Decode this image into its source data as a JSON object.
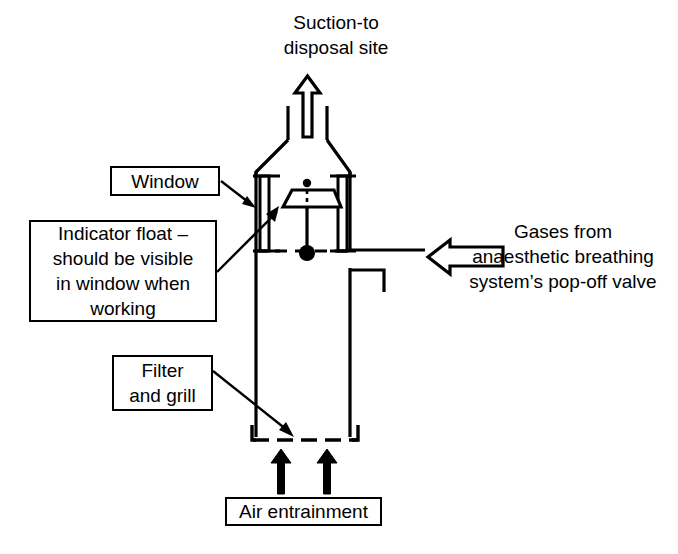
{
  "diagram": {
    "labels": {
      "suction": [
        "Suction-to",
        "disposal site"
      ],
      "window": [
        "Window"
      ],
      "indicator_float": [
        "Indicator float –",
        "should be visible",
        "in window when",
        "working"
      ],
      "filter_grill": [
        "Filter",
        "and grill"
      ],
      "air_entrainment": [
        "Air entrainment"
      ],
      "gases": [
        "Gases from",
        "anaesthetic breathing",
        "system’s pop-off valve"
      ]
    },
    "icons": {
      "suction_arrow": "hollow-up-arrow-icon",
      "gas_inlet_arrow": "hollow-left-arrow-icon",
      "air_arrow_left": "solid-up-arrow-icon",
      "air_arrow_right": "solid-up-arrow-icon",
      "float": "trapezoid-float-icon",
      "window_left": "window-slot-icon",
      "window_right": "window-slot-icon",
      "grill": "dashed-grill-icon",
      "liquid_level": "dashed-level-line-icon",
      "float_pivot": "filled-circle-icon"
    },
    "colors": {
      "stroke": "#000000",
      "fill": "#ffffff",
      "background": "#ffffff"
    }
  }
}
